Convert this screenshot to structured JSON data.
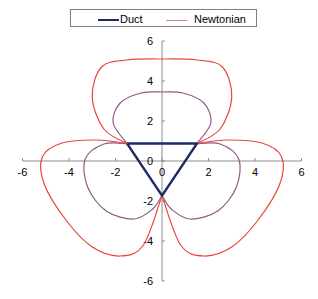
{
  "chart_data": {
    "type": "line",
    "title": "",
    "xlabel": "",
    "ylabel": "",
    "xlim": [
      -6,
      6
    ],
    "ylim": [
      -6,
      6
    ],
    "x_ticks": [
      "-6",
      "-4",
      "-2",
      "0",
      "2",
      "4",
      "6"
    ],
    "y_ticks": [
      "6",
      "4",
      "2",
      "0",
      "-2",
      "-4",
      "-6"
    ],
    "grid": false,
    "legend_position": "top",
    "series": [
      {
        "name": "Duct",
        "color": "#1f2a6b",
        "points": [
          [
            -1.5,
            0.87
          ],
          [
            1.5,
            0.87
          ],
          [
            0,
            -1.73
          ],
          [
            -1.5,
            0.87
          ]
        ]
      },
      {
        "name": "Newtonian",
        "color": "#e8463a",
        "role": "outer lobes",
        "points": [
          [
            -1.5,
            0.87
          ],
          [
            -2.5,
            1.6
          ],
          [
            -3.0,
            3.2
          ],
          [
            -2.6,
            4.7
          ],
          [
            -1.5,
            5.05
          ],
          [
            0,
            5.1
          ],
          [
            1.5,
            5.05
          ],
          [
            2.6,
            4.7
          ],
          [
            3.0,
            3.2
          ],
          [
            2.5,
            1.6
          ],
          [
            1.5,
            0.87
          ],
          [
            2.8,
            1.05
          ],
          [
            4.3,
            0.9
          ],
          [
            5.15,
            0.2
          ],
          [
            5.05,
            -1.2
          ],
          [
            4.1,
            -3.0
          ],
          [
            3.0,
            -4.3
          ],
          [
            1.8,
            -4.75
          ],
          [
            0.8,
            -4.2
          ],
          [
            0,
            -1.73
          ],
          [
            -0.8,
            -4.2
          ],
          [
            -1.8,
            -4.75
          ],
          [
            -3.0,
            -4.3
          ],
          [
            -4.1,
            -3.0
          ],
          [
            -5.05,
            -1.2
          ],
          [
            -5.15,
            0.2
          ],
          [
            -4.3,
            0.9
          ],
          [
            -2.8,
            1.05
          ],
          [
            -1.5,
            0.87
          ]
        ]
      },
      {
        "name": "Newtonian (inner)",
        "color": "#8e5a86",
        "role": "inner lobes",
        "points": [
          [
            -1.5,
            0.87
          ],
          [
            -2.1,
            1.9
          ],
          [
            -1.8,
            2.9
          ],
          [
            -0.9,
            3.4
          ],
          [
            0,
            3.45
          ],
          [
            0.9,
            3.4
          ],
          [
            1.8,
            2.9
          ],
          [
            2.1,
            1.9
          ],
          [
            1.5,
            0.87
          ],
          [
            2.5,
            0.85
          ],
          [
            3.3,
            0.1
          ],
          [
            3.2,
            -1.3
          ],
          [
            2.4,
            -2.5
          ],
          [
            1.2,
            -2.9
          ],
          [
            0.4,
            -2.4
          ],
          [
            0,
            -1.73
          ],
          [
            -0.4,
            -2.4
          ],
          [
            -1.2,
            -2.9
          ],
          [
            -2.4,
            -2.5
          ],
          [
            -3.2,
            -1.3
          ],
          [
            -3.3,
            0.1
          ],
          [
            -2.5,
            0.85
          ],
          [
            -1.5,
            0.87
          ]
        ]
      }
    ]
  },
  "legend": {
    "items": [
      {
        "label": "Duct",
        "color": "#1f2a6b"
      },
      {
        "label": "Newtonian",
        "color": "#d98a8a"
      }
    ]
  }
}
